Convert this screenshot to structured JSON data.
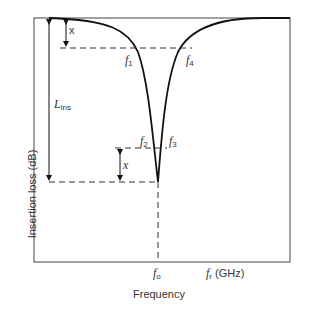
{
  "diagram": {
    "y_axis_label": "Insertion loss (dB)",
    "x_axis_label": "Frequency",
    "x_axis_unit_label": {
      "symbol": "f",
      "subscript": "r",
      "unit": "(GHz)"
    },
    "center_frequency": {
      "symbol": "f",
      "subscript": "o"
    },
    "markers": [
      {
        "symbol": "f",
        "subscript": "1"
      },
      {
        "symbol": "f",
        "subscript": "2"
      },
      {
        "symbol": "f",
        "subscript": "3"
      },
      {
        "symbol": "f",
        "subscript": "4"
      }
    ],
    "dimension_labels": {
      "top_x": "x",
      "bottom_x": "x",
      "insertion_loss": {
        "symbol": "L",
        "subscript": "ins"
      }
    },
    "colors": {
      "curve": "#111111",
      "frame": "#444444",
      "dashed": "#333333"
    }
  }
}
